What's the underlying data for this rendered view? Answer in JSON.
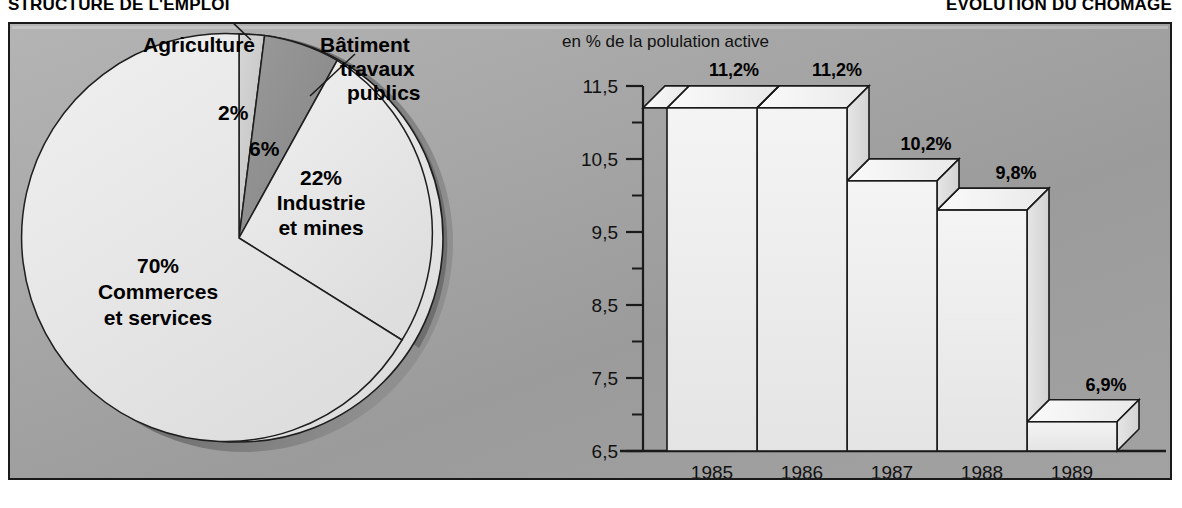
{
  "headings": {
    "left": "STRUCTURE DE  L'EMPLOI",
    "right": "EVOLUTION DU CHOMAGE"
  },
  "colors": {
    "panel_bg": "#a5a5a5",
    "panel_border": "#1a1a1a",
    "pie_major": "#e8e8e8",
    "pie_minor": "#c9c9c9",
    "pie_dark": "#8f8f8f",
    "pie_rim": "#6f6f6f",
    "bar_face": "#eeeeee",
    "bar_top": "#f6f6f6",
    "bar_side": "#dcdcdc",
    "bar_outline": "#1a1a1a",
    "text": "#000000"
  },
  "pie_chart": {
    "type": "pie",
    "title": "STRUCTURE DE  L'EMPLOI",
    "callout_labels": [
      "Agriculture",
      "Bâtiment travaux publics"
    ],
    "slices": [
      {
        "label": "Commerces et services",
        "value": 70,
        "value_label": "70%",
        "tone": "major"
      },
      {
        "label": "Agriculture",
        "value": 2,
        "value_label": "2%",
        "tone": "minor"
      },
      {
        "label": "Bâtiment travaux publics",
        "value": 6,
        "value_label": "6%",
        "tone": "dark"
      },
      {
        "label": "Industrie et mines",
        "value": 22,
        "value_label": "22%",
        "tone": "major"
      }
    ],
    "annotations": {
      "agriculture": "Agriculture",
      "btp_line1": "Bâtiment",
      "btp_line2": "travaux",
      "btp_line3": "publics",
      "pct2": "2%",
      "pct6": "6%",
      "pct22": "22%",
      "industrie_line1": "Industrie",
      "industrie_line2": "et mines",
      "pct70": "70%",
      "commerces_line1": "Commerces",
      "commerces_line2": "et services"
    }
  },
  "bar_chart": {
    "type": "bar",
    "title": "EVOLUTION DU CHOMAGE",
    "axis_note": "en % de la polulation active",
    "categories": [
      "1985",
      "1986",
      "1987",
      "1988",
      "1989"
    ],
    "values": [
      11.2,
      11.2,
      10.2,
      9.8,
      6.9
    ],
    "value_labels": [
      "11,2%",
      "11,2%",
      "10,2%",
      "9,8%",
      "6,9%"
    ],
    "ylabel": "",
    "xlabel": "",
    "ylim": [
      6.5,
      11.5
    ],
    "ytick_labels": [
      "11,5",
      "10,5",
      "9,5",
      "8,5",
      "7,5",
      "6,5"
    ],
    "ytick_values": [
      11.5,
      10.5,
      9.5,
      8.5,
      7.5,
      6.5
    ],
    "minor_ticks": [
      11.0,
      10.0,
      9.0,
      8.0,
      7.0
    ],
    "grid": false,
    "legend": "none"
  }
}
